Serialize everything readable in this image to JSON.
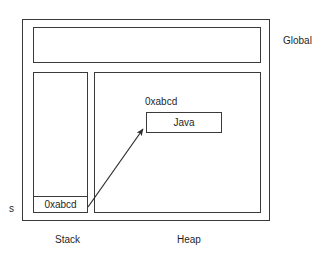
{
  "diagram": {
    "regions": {
      "global": {
        "label": "Global",
        "name": "global-region"
      },
      "stack": {
        "label": "Stack",
        "name": "stack-region"
      },
      "heap": {
        "label": "Heap",
        "name": "heap-region"
      }
    },
    "stack": {
      "variable_label": "s",
      "slot_value": "0xabcd"
    },
    "heap": {
      "address_label": "0xabcd",
      "object_value": "Java"
    },
    "arrow": {
      "name": "reference-arrow",
      "from": {
        "x": 88,
        "y": 207
      },
      "to": {
        "x": 143,
        "y": 129
      }
    },
    "colors": {
      "stroke": "#3a3a3a",
      "text": "#1f1f1f",
      "background": "#ffffff",
      "arrow": "#2b2b2b"
    }
  }
}
